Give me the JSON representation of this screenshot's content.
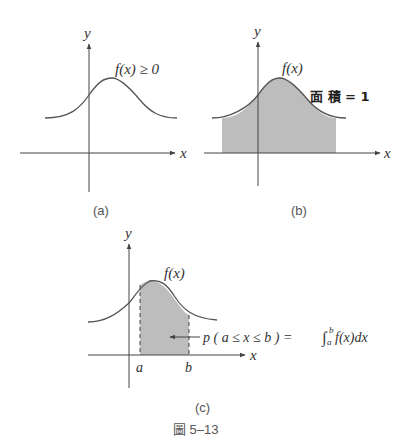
{
  "figure": {
    "caption": "圖 5–13",
    "panels": [
      {
        "id": "a",
        "label": "(a)",
        "curve_label": "f(x) ≥ 0",
        "x_axis": "x",
        "y_axis": "y"
      },
      {
        "id": "b",
        "label": "(b)",
        "curve_label": "f(x)",
        "area_label": "面 積 = 1",
        "x_axis": "x",
        "y_axis": "y"
      },
      {
        "id": "c",
        "label": "(c)",
        "curve_label": "f(x)",
        "x_axis": "x",
        "y_axis": "y",
        "bound_a": "a",
        "bound_b": "b",
        "annotation": "p ( a ≤ x ≤ b ) = ∫ₐᵇ f(x)dx",
        "annotation_parts": {
          "lhs": "p ( a ≤ x ≤ b ) = ",
          "int": "∫",
          "sup": "b",
          "sub": "a",
          "rhs": "f(x)dx"
        }
      }
    ]
  },
  "colors": {
    "curve": "#555555",
    "axis": "#444444",
    "shade": "#bdbdbd",
    "text": "#333333"
  }
}
